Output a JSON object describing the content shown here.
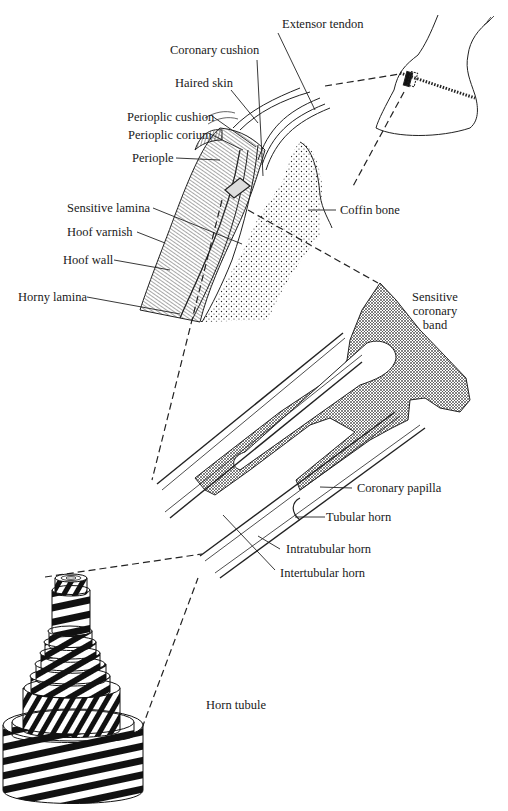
{
  "diagram": {
    "colors": {
      "ink": "#1a1a1a",
      "background": "#ffffff"
    },
    "labels": {
      "extensor_tendon": "Extensor tendon",
      "coronary_cushion": "Coronary cushion",
      "haired_skin": "Haired skin",
      "perioplic_cushion": "Perioplic cushion",
      "perioplic_corium": "Perioplic corium",
      "periople": "Periople",
      "sensitive_lamina": "Sensitive lamina",
      "hoof_varnish": "Hoof varnish",
      "hoof_wall": "Hoof wall",
      "horny_lamina": "Horny lamina",
      "coffin_bone": "Coffin bone",
      "sensitive_coronary_band": "Sensitive coronary band",
      "coronary_papilla": "Coronary papilla",
      "tubular_horn": "Tubular horn",
      "intratubular_horn": "Intratubular horn",
      "intertubular_horn": "Intertubular horn",
      "horn_tubule": "Horn tubule"
    },
    "panels": [
      {
        "name": "hoof-overview",
        "description": "Outline of horse hoof with small rectangle marking the section"
      },
      {
        "name": "coronary-section",
        "description": "Cross-section through coronary band and hoof wall"
      },
      {
        "name": "papilla-detail",
        "description": "Magnified coronary papillae producing horn tubules"
      },
      {
        "name": "horn-tubule-model",
        "description": "Striped concentric cylinder model of a horn tubule"
      }
    ]
  }
}
